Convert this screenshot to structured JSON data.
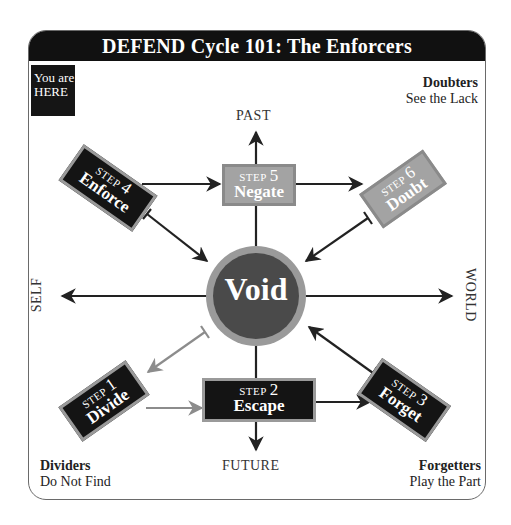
{
  "title": "DEFEND Cycle 101: The Enforcers",
  "here_badge": {
    "line1": "You are",
    "line2": "HERE"
  },
  "corners": {
    "top_right": {
      "head": "Doubters",
      "sub": "See the Lack"
    },
    "bottom_left": {
      "head": "Dividers",
      "sub": "Do Not Find"
    },
    "bottom_right": {
      "head": "Forgetters",
      "sub": "Play the Part"
    }
  },
  "axes": {
    "top": "PAST",
    "bottom": "FUTURE",
    "left": "SELF",
    "right": "WORLD"
  },
  "center": {
    "label": "Void",
    "fill": "#4a4a4a",
    "ring": "#9a9a9a"
  },
  "steps": [
    {
      "step_word": "STEP",
      "number": "1",
      "name": "Divide",
      "style": "dark"
    },
    {
      "step_word": "STEP",
      "number": "2",
      "name": "Escape",
      "style": "dark"
    },
    {
      "step_word": "STEP",
      "number": "3",
      "name": "Forget",
      "style": "dark"
    },
    {
      "step_word": "STEP",
      "number": "4",
      "name": "Enforce",
      "style": "dark"
    },
    {
      "step_word": "STEP",
      "number": "5",
      "name": "Negate",
      "style": "light"
    },
    {
      "step_word": "STEP",
      "number": "6",
      "name": "Doubt",
      "style": "light"
    }
  ],
  "colors": {
    "title_bar": "#111111",
    "dark_box": "#141414",
    "light_box": "#a3a3a3",
    "arrow_dark": "#222222",
    "arrow_light": "#8c8c8c"
  }
}
